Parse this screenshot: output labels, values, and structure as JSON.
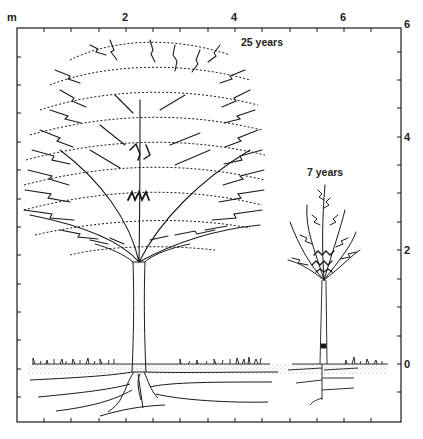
{
  "figure": {
    "unit_label": "m",
    "x_axis": {
      "tick_labels": [
        {
          "value": "2",
          "x": 125
        },
        {
          "value": "4",
          "x": 234
        },
        {
          "value": "6",
          "x": 343
        }
      ]
    },
    "y_axis": {
      "tick_labels": [
        {
          "value": "6",
          "y": 24
        },
        {
          "value": "4",
          "y": 137
        },
        {
          "value": "2",
          "y": 250
        },
        {
          "value": "0",
          "y": 364
        }
      ]
    },
    "trees": [
      {
        "label": "25 years",
        "height_m": 6,
        "crown_width_m": 4.5
      },
      {
        "label": "7 years",
        "height_m": 3,
        "crown_width_m": 1.7
      }
    ],
    "colors": {
      "ink": "#1a1a1a",
      "paper": "#ffffff",
      "soil_stipple": "#9a9a9a"
    }
  }
}
